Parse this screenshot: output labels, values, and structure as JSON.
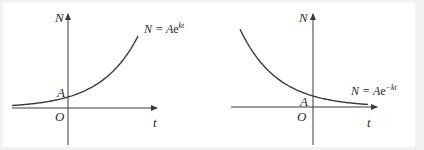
{
  "graphs": [
    {
      "id": "growth",
      "y_axis_label": "N",
      "x_axis_label": "t",
      "origin_label": "O",
      "intercept_label": "A",
      "equation": {
        "lhs": "N = A",
        "base": "e",
        "exponent": "kt"
      },
      "sign": 1
    },
    {
      "id": "decay",
      "y_axis_label": "N",
      "x_axis_label": "t",
      "origin_label": "O",
      "intercept_label": "A",
      "equation": {
        "lhs": "N = A",
        "base": "e",
        "exponent": "−kt"
      },
      "sign": -1
    }
  ]
}
